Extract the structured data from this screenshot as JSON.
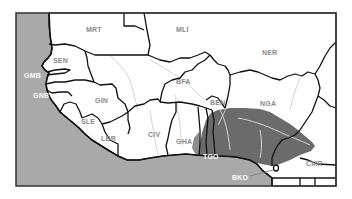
{
  "map": {
    "title": "West Africa country map with shaded region",
    "colors": {
      "ocean": "#a9a9a9",
      "land": "#ffffff",
      "shaded_region": "#6b6b6b",
      "border": "#111111",
      "river": "#d4d4d4",
      "frame": "#333333"
    },
    "countries": [
      {
        "code": "MRT",
        "name_visible": "MRT"
      },
      {
        "code": "MLI",
        "name_visible": "MLI"
      },
      {
        "code": "NER",
        "name_visible": "NER"
      },
      {
        "code": "SEN",
        "name_visible": "SEN"
      },
      {
        "code": "GMB",
        "name_visible": "GMB"
      },
      {
        "code": "GNB",
        "name_visible": "GNB"
      },
      {
        "code": "GIN",
        "name_visible": "GIN"
      },
      {
        "code": "SLE",
        "name_visible": "SLE"
      },
      {
        "code": "LBR",
        "name_visible": "LBR"
      },
      {
        "code": "CIV",
        "name_visible": "CIV"
      },
      {
        "code": "BFA",
        "name_visible": "BFA"
      },
      {
        "code": "GHA",
        "name_visible": "GHA"
      },
      {
        "code": "TGO",
        "name_visible": "TGO"
      },
      {
        "code": "BEN",
        "name_visible": "BEN"
      },
      {
        "code": "NGA",
        "name_visible": "NGA"
      },
      {
        "code": "CMR",
        "name_visible": "CMR"
      },
      {
        "code": "BKO",
        "name_visible": "BKO"
      }
    ],
    "labels": {
      "mrt": "MRT",
      "mli": "MLI",
      "ner": "NER",
      "sen": "SEN",
      "gmb": "GMB",
      "gnb": "GNB",
      "gin": "GIN",
      "sle": "SLE",
      "lbr": "LBR",
      "civ": "CIV",
      "bfa": "BFA",
      "gha": "GHA",
      "tgo": "TGO",
      "ben": "BEN",
      "nga": "NGA",
      "cmr": "CMR",
      "bko": "BKO"
    }
  }
}
